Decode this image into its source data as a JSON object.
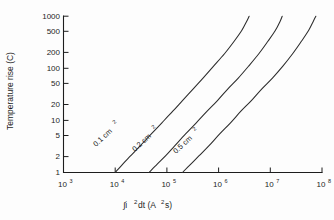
{
  "chart_data": {
    "type": "line",
    "title": "",
    "xlabel": "∫i²dt (A²s)",
    "ylabel": "Temperature rise (C)",
    "xscale": "log",
    "yscale": "log",
    "xlim": [
      1000,
      100000000
    ],
    "ylim": [
      1,
      1000
    ],
    "grid": false,
    "legend_position": "inline-curve-labels",
    "x_tick_labels": [
      "10³",
      "10⁴",
      "10⁵",
      "10⁶",
      "10⁷",
      "10⁸"
    ],
    "x_tick_values": [
      1000,
      10000,
      100000,
      1000000,
      10000000,
      100000000
    ],
    "x_tick_mantissa": [
      "10",
      "10",
      "10",
      "10",
      "10",
      "10"
    ],
    "x_tick_exponent": [
      "3",
      "4",
      "5",
      "6",
      "7",
      "8"
    ],
    "y_tick_labels": [
      "1",
      "2",
      "5",
      "10",
      "20",
      "50",
      "100",
      "200",
      "500",
      "1000"
    ],
    "y_tick_values": [
      1,
      2,
      5,
      10,
      20,
      50,
      100,
      200,
      500,
      1000
    ],
    "series": [
      {
        "name": "0.1 cm²",
        "label_text": "0.1 cm",
        "label_sup": "2",
        "points": [
          [
            10000,
            1.0
          ],
          [
            14000,
            1.45
          ],
          [
            20000,
            2.1
          ],
          [
            30000,
            3.2
          ],
          [
            50000,
            5.5
          ],
          [
            80000,
            9.0
          ],
          [
            130000,
            15.0
          ],
          [
            200000,
            24.0
          ],
          [
            320000,
            40.0
          ],
          [
            500000,
            65.0
          ],
          [
            800000,
            110.0
          ],
          [
            1300000,
            190.0
          ],
          [
            2000000,
            330.0
          ],
          [
            2800000,
            530.0
          ],
          [
            3500000,
            800.0
          ],
          [
            3900000,
            1000.0
          ]
        ]
      },
      {
        "name": "0.2 cm²",
        "label_text": "0.2 cm",
        "label_sup": "2",
        "points": [
          [
            45000,
            1.0
          ],
          [
            65000,
            1.45
          ],
          [
            95000,
            2.1
          ],
          [
            140000,
            3.2
          ],
          [
            230000,
            5.5
          ],
          [
            370000,
            9.0
          ],
          [
            600000,
            15.0
          ],
          [
            950000,
            24.0
          ],
          [
            1500000,
            40.0
          ],
          [
            2400000,
            65.0
          ],
          [
            3800000,
            110.0
          ],
          [
            6000000,
            190.0
          ],
          [
            9000000,
            330.0
          ],
          [
            12500000,
            530.0
          ],
          [
            15500000,
            800.0
          ],
          [
            17000000,
            1000.0
          ]
        ]
      },
      {
        "name": "0.5 cm²",
        "label_text": "0.5 cm",
        "label_sup": "2",
        "points": [
          [
            200000,
            1.0
          ],
          [
            290000,
            1.45
          ],
          [
            420000,
            2.1
          ],
          [
            640000,
            3.2
          ],
          [
            1050000,
            5.5
          ],
          [
            1700000,
            9.0
          ],
          [
            2700000,
            15.0
          ],
          [
            4300000,
            24.0
          ],
          [
            6800000,
            40.0
          ],
          [
            11000000,
            65.0
          ],
          [
            17500000,
            110.0
          ],
          [
            27000000,
            190.0
          ],
          [
            40000000,
            330.0
          ],
          [
            55000000,
            530.0
          ],
          [
            68000000,
            800.0
          ],
          [
            76000000,
            1000.0
          ]
        ]
      }
    ]
  },
  "figure": {
    "background_color": "#fdfdfd",
    "axis_color": "#1d1d1d",
    "curve_color": "#2b2b2b"
  }
}
